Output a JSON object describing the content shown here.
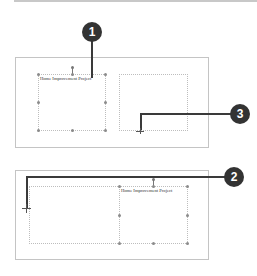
{
  "panels": [
    {
      "name": "before-resize",
      "text_box_label": "Home Improvement Project",
      "callouts": [
        {
          "number": "1",
          "target": "text box"
        },
        {
          "number": "3",
          "target": "drag handle"
        }
      ]
    },
    {
      "name": "after-resize",
      "text_box_label": "Home Improvement Project",
      "callouts": [
        {
          "number": "2",
          "target": "crosshair pointer"
        }
      ]
    }
  ],
  "colors": {
    "callout_fill": "#333333",
    "callout_text": "#ffffff",
    "leader_line": "#3a3a3a",
    "frame_border": "#c4c4c4",
    "dotted_border": "#bdbdbd"
  }
}
